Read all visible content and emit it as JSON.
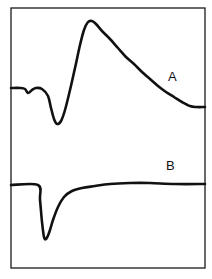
{
  "chart_data": {
    "type": "line",
    "title": "",
    "xlabel": "",
    "ylabel": "",
    "grid": false,
    "legend": "none",
    "frame": {
      "x": 11,
      "y": 8,
      "width": 194,
      "height": 260
    },
    "series": [
      {
        "name": "A",
        "label": "A",
        "label_pos": [
          168,
          81
        ],
        "description": "Biphasic waveform: flat baseline with small notch, sharp negative dip, steep rise to a peak, then slow exponential decay to baseline",
        "points": [
          [
            11,
            88
          ],
          [
            20,
            88
          ],
          [
            25,
            89
          ],
          [
            28,
            93
          ],
          [
            32,
            90
          ],
          [
            36,
            88
          ],
          [
            42,
            89
          ],
          [
            48,
            96
          ],
          [
            51,
            108
          ],
          [
            54,
            119
          ],
          [
            57,
            124
          ],
          [
            61,
            121
          ],
          [
            65,
            110
          ],
          [
            70,
            90
          ],
          [
            75,
            68
          ],
          [
            80,
            45
          ],
          [
            84,
            30
          ],
          [
            88,
            22
          ],
          [
            92,
            21
          ],
          [
            96,
            24
          ],
          [
            102,
            31
          ],
          [
            110,
            39
          ],
          [
            118,
            48
          ],
          [
            126,
            57
          ],
          [
            134,
            64
          ],
          [
            142,
            72
          ],
          [
            150,
            79
          ],
          [
            158,
            86
          ],
          [
            166,
            92
          ],
          [
            174,
            97
          ],
          [
            182,
            102
          ],
          [
            190,
            106
          ],
          [
            196,
            107
          ],
          [
            205,
            107
          ]
        ]
      },
      {
        "name": "B",
        "label": "B",
        "label_pos": [
          166,
          170
        ],
        "description": "Flat baseline, abrupt downward step to a sharp negative minimum, then exponential recovery back to baseline",
        "points": [
          [
            11,
            185
          ],
          [
            38,
            185
          ],
          [
            40,
            200
          ],
          [
            42,
            222
          ],
          [
            44,
            237
          ],
          [
            46,
            239
          ],
          [
            49,
            233
          ],
          [
            53,
            220
          ],
          [
            58,
            207
          ],
          [
            64,
            197
          ],
          [
            72,
            191
          ],
          [
            82,
            188
          ],
          [
            95,
            186
          ],
          [
            110,
            184
          ],
          [
            130,
            183
          ],
          [
            150,
            183
          ],
          [
            175,
            184
          ],
          [
            205,
            184
          ]
        ]
      }
    ]
  }
}
